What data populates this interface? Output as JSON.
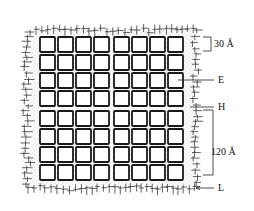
{
  "diagram": {
    "type": "lattice-schematic",
    "grid": {
      "rows": 8,
      "cols": 8,
      "origin_x": 40,
      "origin_y": 37,
      "cell_size": 15,
      "pitch": 18,
      "center_gap_extra": 2,
      "cell_stroke": "#1a1a1a"
    },
    "regions": {
      "stipple_color": "#9a9a9a",
      "hatch_color": "#3a3a3a"
    },
    "labels": {
      "dim_top": "30 Å",
      "E": "E",
      "H": "H",
      "dim_bottom": "120 Å",
      "L": "L"
    }
  }
}
